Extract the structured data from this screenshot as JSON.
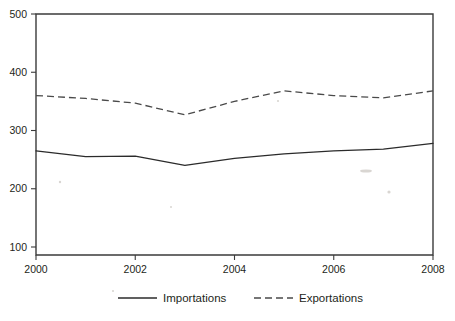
{
  "chart_data": {
    "type": "line",
    "title": "",
    "subtitle": "",
    "xlabel": "",
    "ylabel": "",
    "x": [
      2000,
      2001,
      2002,
      2003,
      2004,
      2005,
      2006,
      2007,
      2008
    ],
    "xtick_labels": [
      "2000",
      "2002",
      "2004",
      "2006",
      "2008"
    ],
    "xtick_values": [
      2000,
      2002,
      2004,
      2006,
      2008
    ],
    "xlim": [
      2000,
      2008
    ],
    "ytick_labels": [
      "100",
      "200",
      "300",
      "400",
      "500"
    ],
    "ytick_values": [
      100,
      200,
      300,
      400,
      500
    ],
    "ylim": [
      100,
      500
    ],
    "grid": false,
    "legend_position": "bottom",
    "series": [
      {
        "name": "Importations",
        "style": "solid",
        "color": "#2b2b2b",
        "values": [
          265,
          255,
          256,
          240,
          252,
          260,
          265,
          268,
          278
        ]
      },
      {
        "name": "Exportations",
        "style": "dashed",
        "color": "#4a4a4a",
        "values": [
          360,
          355,
          347,
          327,
          350,
          368,
          360,
          356,
          368
        ]
      }
    ]
  },
  "legend": {
    "items": [
      {
        "label": "Importations",
        "style": "solid"
      },
      {
        "label": "Exportations",
        "style": "dashed"
      }
    ]
  }
}
